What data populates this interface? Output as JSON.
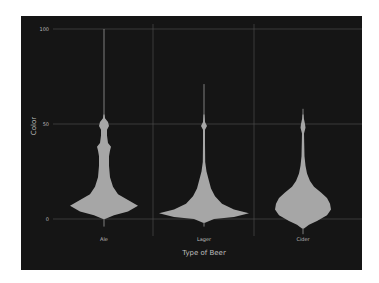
{
  "chart_data": {
    "type": "violin",
    "title": "",
    "xlabel": "Type of Beer",
    "ylabel": "Color",
    "categories": [
      "Ale",
      "Lager",
      "Cider"
    ],
    "ylim": [
      0,
      100
    ],
    "yticks": [
      0,
      50,
      100
    ],
    "grid": true,
    "legend": null,
    "colors": {
      "background": "#151515",
      "violin": "#a6a6a6",
      "grid": "#4a4a4a",
      "text": "#bdbdbd"
    },
    "series": [
      {
        "name": "Ale",
        "whisker_range": [
          -4,
          100
        ],
        "mode_value": 7,
        "max_half_width": 34,
        "profile": [
          [
            0,
            1
          ],
          [
            2,
            10
          ],
          [
            4,
            24
          ],
          [
            7,
            34
          ],
          [
            10,
            24
          ],
          [
            13,
            14
          ],
          [
            17,
            9
          ],
          [
            22,
            6
          ],
          [
            28,
            5
          ],
          [
            33,
            5
          ],
          [
            36,
            6
          ],
          [
            38,
            7
          ],
          [
            40,
            4
          ],
          [
            44,
            3
          ],
          [
            47,
            3
          ],
          [
            49,
            5
          ],
          [
            51,
            4
          ],
          [
            53,
            1
          ],
          [
            55,
            0.5
          ]
        ]
      },
      {
        "name": "Lager",
        "whisker_range": [
          -4,
          71
        ],
        "mode_value": 3,
        "max_half_width": 45,
        "profile": [
          [
            -2,
            1
          ],
          [
            0,
            10
          ],
          [
            1,
            30
          ],
          [
            3,
            45
          ],
          [
            5,
            30
          ],
          [
            8,
            18
          ],
          [
            12,
            11
          ],
          [
            16,
            7
          ],
          [
            20,
            5
          ],
          [
            25,
            2.5
          ],
          [
            30,
            1.2
          ],
          [
            40,
            1
          ],
          [
            47,
            1
          ],
          [
            49,
            3
          ],
          [
            51,
            1
          ],
          [
            55,
            0.5
          ]
        ]
      },
      {
        "name": "Cider",
        "whisker_range": [
          -8,
          58
        ],
        "mode_value": 7,
        "max_half_width": 28,
        "profile": [
          [
            -5,
            1
          ],
          [
            -3,
            6
          ],
          [
            -1,
            14
          ],
          [
            2,
            24
          ],
          [
            5,
            28
          ],
          [
            8,
            27
          ],
          [
            11,
            24
          ],
          [
            14,
            18
          ],
          [
            17,
            11
          ],
          [
            20,
            7
          ],
          [
            24,
            4
          ],
          [
            28,
            2.5
          ],
          [
            33,
            1.5
          ],
          [
            40,
            1.2
          ],
          [
            45,
            1
          ],
          [
            48,
            2.5
          ],
          [
            50,
            2
          ],
          [
            53,
            0.8
          ],
          [
            55,
            0.5
          ]
        ]
      }
    ]
  },
  "axes": {
    "x_title": "Type of Beer",
    "y_title": "Color",
    "x_ticks": [
      "Ale",
      "Lager",
      "Cider"
    ],
    "y_ticks": [
      "0",
      "50",
      "100"
    ]
  }
}
